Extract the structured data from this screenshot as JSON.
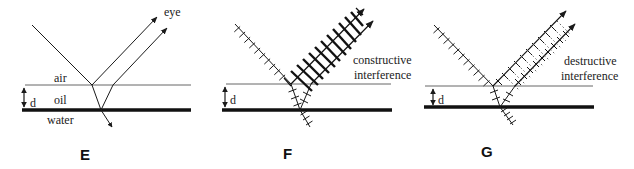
{
  "panels": [
    {
      "id": "E",
      "label": "E",
      "media": {
        "top": "air",
        "middle": "oil",
        "bottom": "water"
      },
      "thickness_label": "d",
      "viewer_label": "eye"
    },
    {
      "id": "F",
      "label": "F",
      "thickness_label": "d",
      "caption_line1": "constructive",
      "caption_line2": "interference"
    },
    {
      "id": "G",
      "label": "G",
      "thickness_label": "d",
      "caption_line1": "destructive",
      "caption_line2": "interference"
    }
  ],
  "colors": {
    "line": "#1a1a1a",
    "surface": "#555555",
    "background": "#ffffff"
  }
}
